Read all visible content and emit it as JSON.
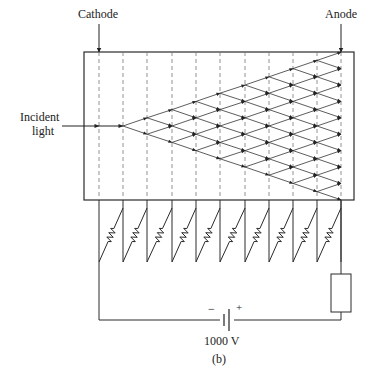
{
  "diagram": {
    "caption": "(b)",
    "labels": {
      "cathode": "Cathode",
      "anode": "Anode",
      "incident_light_line1": "Incident",
      "incident_light_line2": "light",
      "battery_minus": "−",
      "battery_plus": "+",
      "voltage": "1000 V"
    },
    "colors": {
      "line": "#2a2a2a",
      "dashed": "#777777",
      "background": "#ffffff"
    },
    "tube": {
      "x": 84,
      "y": 52,
      "width": 270,
      "height": 148
    },
    "electrodes_x": [
      99,
      123,
      147,
      172,
      196,
      220,
      245,
      269,
      293,
      317,
      341
    ],
    "dynode_count": 9,
    "resistor_count": 10,
    "supply_voltage_V": 1000
  }
}
